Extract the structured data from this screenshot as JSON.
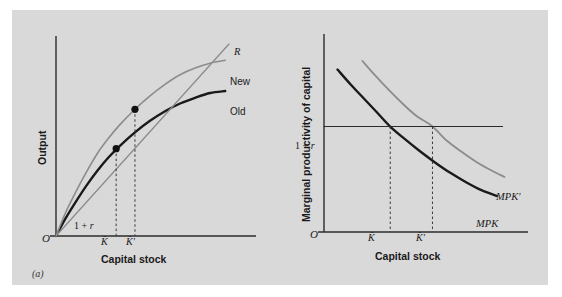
{
  "figure": {
    "background_color": "#d9d9d9",
    "page_color": "#ffffff",
    "axis_color": "#2b2b2b",
    "old_curve_color": "#1a1a1a",
    "new_curve_color": "#8c8c8c",
    "ray_color": "#8c8c8c",
    "dash_color": "#3a3a3a",
    "dot_color": "#111111"
  },
  "panel_a": {
    "caption": "(a)",
    "y_axis_title": "Output",
    "x_axis_title": "Capital stock",
    "origin_label": "O",
    "slope_label_prefix": "1 + ",
    "slope_label_var": "r",
    "ray_label": "R",
    "new_curve_label": "New",
    "old_curve_label": "Old",
    "tick_k": "K̄",
    "tick_k_prime": "K̄′"
  },
  "panel_b": {
    "caption": "(b)",
    "y_axis_title": "Marginal productivity of capital",
    "x_axis_title": "Capital stock",
    "origin_label": "O",
    "rate_line_label_prefix": "1 + ",
    "rate_line_label_var": "r",
    "mpk_label": "MPK",
    "mpk_prime_label": "MPK′",
    "tick_k": "K̄",
    "tick_k_prime": "K̄′"
  },
  "chart_data": [
    {
      "type": "line",
      "panel": "(a)",
      "title": "",
      "xlabel": "Capital stock",
      "ylabel": "Output",
      "xlim": [
        0,
        1
      ],
      "ylim": [
        0,
        1
      ],
      "grid": false,
      "legend": "inline-right",
      "annotations": [
        {
          "text": "1 + r",
          "kind": "slope-of-ray",
          "at_x": 0.11,
          "at_y": 0.1
        },
        {
          "text": "O",
          "kind": "origin",
          "at_x": 0.0,
          "at_y": 0.0
        },
        {
          "text": "K̄",
          "kind": "x-tick",
          "at_x": 0.32
        },
        {
          "text": "K̄′",
          "kind": "x-tick",
          "at_x": 0.42
        }
      ],
      "series": [
        {
          "name": "Old",
          "color": "#1a1a1a",
          "style": "solid",
          "width": 2.4,
          "x": [
            0.0,
            0.05,
            0.1,
            0.16,
            0.22,
            0.28,
            0.34,
            0.42,
            0.5,
            0.58,
            0.66,
            0.74,
            0.82,
            0.9
          ],
          "y": [
            0.0,
            0.09,
            0.17,
            0.26,
            0.34,
            0.41,
            0.47,
            0.54,
            0.6,
            0.65,
            0.69,
            0.72,
            0.745,
            0.755
          ]
        },
        {
          "name": "New",
          "color": "#8c8c8c",
          "style": "solid",
          "width": 1.6,
          "x": [
            0.0,
            0.05,
            0.1,
            0.16,
            0.22,
            0.28,
            0.34,
            0.42,
            0.5,
            0.58,
            0.66,
            0.74,
            0.82,
            0.9
          ],
          "y": [
            0.0,
            0.12,
            0.22,
            0.33,
            0.43,
            0.51,
            0.58,
            0.66,
            0.73,
            0.79,
            0.84,
            0.875,
            0.9,
            0.915
          ]
        },
        {
          "name": "R",
          "color": "#8c8c8c",
          "style": "solid",
          "width": 1.3,
          "x": [
            0.0,
            0.92
          ],
          "y": [
            0.0,
            1.0
          ],
          "note": "ray through origin with slope 1 + r"
        }
      ],
      "points": [
        {
          "name": "old-optimum",
          "x": 0.32,
          "y": 0.455,
          "on_series": "Old",
          "marker": "filled-circle"
        },
        {
          "name": "new-optimum",
          "x": 0.42,
          "y": 0.66,
          "on_series": "New",
          "marker": "filled-circle"
        }
      ],
      "dashed_drops": [
        {
          "from_point": "old-optimum",
          "to_axis": "x",
          "at_x": 0.32
        },
        {
          "from_point": "new-optimum",
          "to_axis": "x",
          "at_x": 0.42
        }
      ]
    },
    {
      "type": "line",
      "panel": "(b)",
      "title": "",
      "xlabel": "Capital stock",
      "ylabel": "Marginal productivity of capital",
      "xlim": [
        0,
        1
      ],
      "ylim": [
        0,
        1
      ],
      "grid": false,
      "legend": "inline-right",
      "annotations": [
        {
          "text": "1 + r",
          "kind": "y-level",
          "at_y": 0.555
        },
        {
          "text": "O",
          "kind": "origin",
          "at_x": 0.0,
          "at_y": 0.0
        },
        {
          "text": "K̄",
          "kind": "x-tick",
          "at_x": 0.345
        },
        {
          "text": "K̄′",
          "kind": "x-tick",
          "at_x": 0.565
        }
      ],
      "series": [
        {
          "name": "MPK",
          "color": "#1a1a1a",
          "style": "solid",
          "width": 2.4,
          "x": [
            0.07,
            0.14,
            0.21,
            0.28,
            0.345,
            0.42,
            0.5,
            0.58,
            0.66,
            0.74,
            0.82,
            0.9
          ],
          "y": [
            0.855,
            0.775,
            0.7,
            0.625,
            0.555,
            0.49,
            0.425,
            0.365,
            0.31,
            0.262,
            0.22,
            0.19
          ]
        },
        {
          "name": "MPK′",
          "color": "#8c8c8c",
          "style": "solid",
          "width": 1.8,
          "x": [
            0.2,
            0.27,
            0.34,
            0.41,
            0.48,
            0.565,
            0.64,
            0.72,
            0.8,
            0.88,
            0.94
          ],
          "y": [
            0.9,
            0.82,
            0.745,
            0.675,
            0.612,
            0.555,
            0.48,
            0.42,
            0.365,
            0.32,
            0.29
          ]
        },
        {
          "name": "1 + r",
          "color": "#2b2b2b",
          "style": "solid",
          "width": 1.1,
          "x": [
            0.0,
            0.93
          ],
          "y": [
            0.555,
            0.555
          ],
          "note": "horizontal required-return line"
        }
      ],
      "intersections": [
        {
          "series": "MPK",
          "with": "1 + r",
          "x": 0.345,
          "y": 0.555,
          "label": "K̄"
        },
        {
          "series": "MPK′",
          "with": "1 + r",
          "x": 0.565,
          "y": 0.555,
          "label": "K̄′"
        }
      ],
      "dashed_drops": [
        {
          "from_x": 0.345,
          "to_axis": "x"
        },
        {
          "from_x": 0.565,
          "to_axis": "x"
        }
      ]
    }
  ]
}
